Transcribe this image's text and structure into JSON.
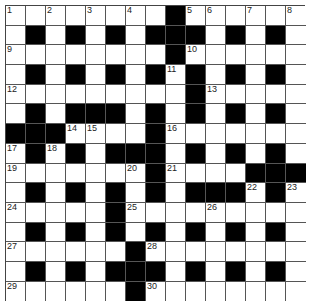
{
  "puzzle": {
    "rows": 15,
    "cols": 15,
    "grid": [
      "........#......",
      ".#.#.#.###.#.#.",
      "........#......",
      ".#.#.#.#.#.#.#.",
      ".........#.....",
      ".#.###.#.#.#.#.",
      "###....#.......",
      ".#.#.###.#.#.#.",
      ".......#....###",
      ".#.#.#.#.###.#.",
      ".....#.........",
      ".#.#.#.#.#.#.#.",
      "......#........",
      ".#.#.###.#.#.#.",
      "......#........"
    ],
    "numbers": [
      {
        "r": 0,
        "c": 0,
        "n": "1"
      },
      {
        "r": 0,
        "c": 2,
        "n": "2"
      },
      {
        "r": 0,
        "c": 4,
        "n": "3"
      },
      {
        "r": 0,
        "c": 6,
        "n": "4"
      },
      {
        "r": 0,
        "c": 9,
        "n": "5"
      },
      {
        "r": 0,
        "c": 10,
        "n": "6"
      },
      {
        "r": 0,
        "c": 12,
        "n": "7"
      },
      {
        "r": 0,
        "c": 14,
        "n": "8"
      },
      {
        "r": 2,
        "c": 0,
        "n": "9"
      },
      {
        "r": 2,
        "c": 9,
        "n": "10"
      },
      {
        "r": 3,
        "c": 8,
        "n": "11"
      },
      {
        "r": 4,
        "c": 0,
        "n": "12"
      },
      {
        "r": 4,
        "c": 10,
        "n": "13"
      },
      {
        "r": 6,
        "c": 3,
        "n": "14"
      },
      {
        "r": 6,
        "c": 4,
        "n": "15"
      },
      {
        "r": 6,
        "c": 8,
        "n": "16"
      },
      {
        "r": 7,
        "c": 0,
        "n": "17"
      },
      {
        "r": 7,
        "c": 2,
        "n": "18"
      },
      {
        "r": 8,
        "c": 0,
        "n": "19"
      },
      {
        "r": 8,
        "c": 6,
        "n": "20"
      },
      {
        "r": 8,
        "c": 8,
        "n": "21"
      },
      {
        "r": 9,
        "c": 12,
        "n": "22"
      },
      {
        "r": 9,
        "c": 14,
        "n": "23"
      },
      {
        "r": 10,
        "c": 0,
        "n": "24"
      },
      {
        "r": 10,
        "c": 6,
        "n": "25"
      },
      {
        "r": 10,
        "c": 10,
        "n": "26"
      },
      {
        "r": 12,
        "c": 0,
        "n": "27"
      },
      {
        "r": 12,
        "c": 7,
        "n": "28"
      },
      {
        "r": 14,
        "c": 0,
        "n": "29"
      },
      {
        "r": 14,
        "c": 7,
        "n": "30"
      }
    ]
  }
}
